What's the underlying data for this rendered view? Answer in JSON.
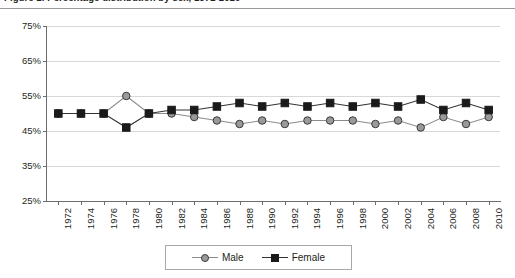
{
  "title": {
    "text": "Figure 1. Percentage distribution by sex, 1972-2010"
  },
  "legend": {
    "male_label": "Male",
    "female_label": "Female"
  },
  "colors": {
    "male": "#9a9a9a",
    "male_line": "#8c8c8c",
    "female": "#1a1a1a",
    "female_line": "#333333",
    "grid": "#d8d8d8",
    "axis": "#6d6d6d",
    "text": "#231f20",
    "background": "#ffffff"
  },
  "chart_data": {
    "type": "line",
    "title": "Figure 1. Percentage distribution by sex, 1972-2010",
    "xlabel": "",
    "ylabel": "",
    "ylim": [
      25,
      75
    ],
    "yticks": [
      25,
      35,
      45,
      55,
      65,
      75
    ],
    "ytick_labels": [
      "25%",
      "35%",
      "45%",
      "55%",
      "65%",
      "75%"
    ],
    "grid": true,
    "legend_position": "bottom",
    "categories": [
      "1972",
      "1974",
      "1976",
      "1978",
      "1980",
      "1982",
      "1984",
      "1986",
      "1988",
      "1990",
      "1992",
      "1994",
      "1996",
      "1998",
      "2000",
      "2002",
      "2004",
      "2006",
      "2008",
      "2010"
    ],
    "x": [
      1972,
      1974,
      1976,
      1978,
      1980,
      1982,
      1984,
      1986,
      1988,
      1990,
      1992,
      1994,
      1996,
      1998,
      2000,
      2002,
      2004,
      2006,
      2008,
      2010
    ],
    "series": [
      {
        "name": "Male",
        "marker": "circle",
        "values": [
          50,
          50,
          50,
          55,
          50,
          50,
          49,
          48,
          47,
          48,
          47,
          48,
          48,
          48,
          47,
          48,
          46,
          49,
          47,
          49
        ]
      },
      {
        "name": "Female",
        "marker": "square",
        "values": [
          50,
          50,
          50,
          46,
          50,
          51,
          51,
          52,
          53,
          52,
          53,
          52,
          53,
          52,
          53,
          52,
          54,
          51,
          53,
          51
        ]
      }
    ]
  }
}
